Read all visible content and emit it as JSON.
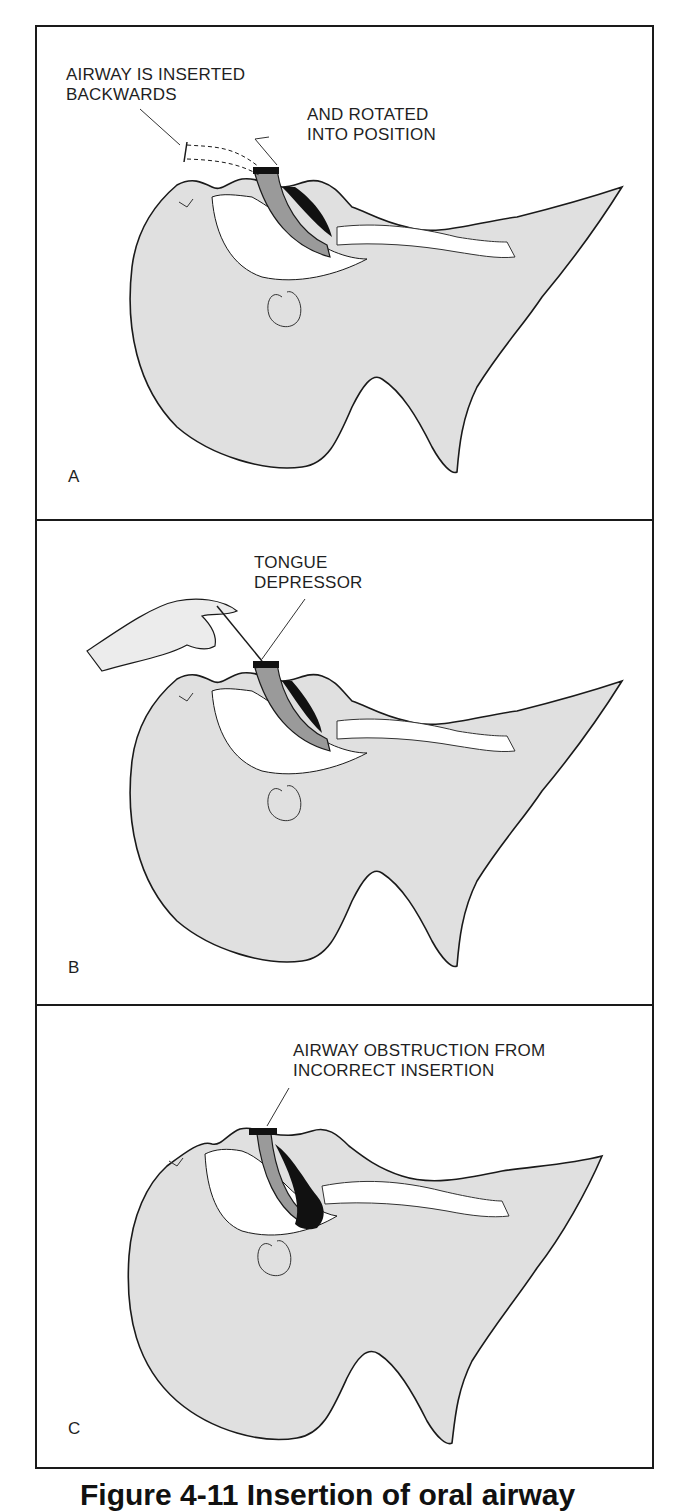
{
  "figure": {
    "colors": {
      "skin_fill": "#e0e0e0",
      "outline": "#1a1a1a",
      "airway_device": "#9a9a9a",
      "obstruction": "#111111",
      "cavity": "#ffffff"
    },
    "panels": [
      {
        "letter": "A",
        "callouts": [
          {
            "lines": [
              "AIRWAY IS INSERTED",
              "BACKWARDS"
            ]
          },
          {
            "lines": [
              "AND ROTATED",
              "INTO POSITION"
            ]
          }
        ]
      },
      {
        "letter": "B",
        "callouts": [
          {
            "lines": [
              "TONGUE",
              "DEPRESSOR"
            ]
          }
        ]
      },
      {
        "letter": "C",
        "callouts": [
          {
            "lines": [
              "AIRWAY OBSTRUCTION FROM",
              "INCORRECT INSERTION"
            ]
          }
        ]
      }
    ],
    "caption": "Figure 4-11 Insertion of oral airway"
  }
}
